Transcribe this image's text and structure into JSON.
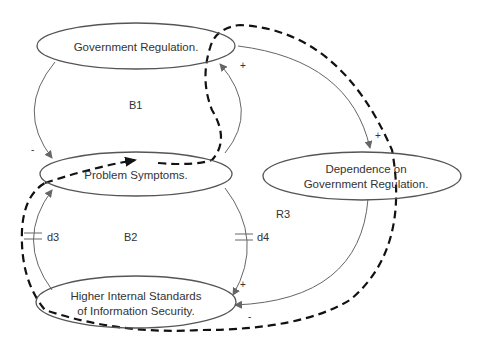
{
  "diagram": {
    "type": "causal-loop",
    "nodes": [
      {
        "id": "gov",
        "lines": [
          "Government Regulation."
        ]
      },
      {
        "id": "prob",
        "lines": [
          "Problem Symptoms."
        ]
      },
      {
        "id": "dep",
        "lines": [
          "Dependence on",
          "Government Regulation."
        ]
      },
      {
        "id": "std",
        "lines": [
          "Higher Internal Standards",
          "of Information Security."
        ]
      }
    ],
    "loops": {
      "b1": "B1",
      "b2": "B2",
      "r3": "R3"
    },
    "delays": {
      "d3": "d3",
      "d4": "d4"
    },
    "polarities": {
      "gov_to_prob": "-",
      "prob_to_gov": "+",
      "gov_to_dep": "+",
      "prob_to_std": "+",
      "dep_to_std": "-"
    },
    "colors": {
      "line": "#666666",
      "dashed": "#111111"
    }
  }
}
